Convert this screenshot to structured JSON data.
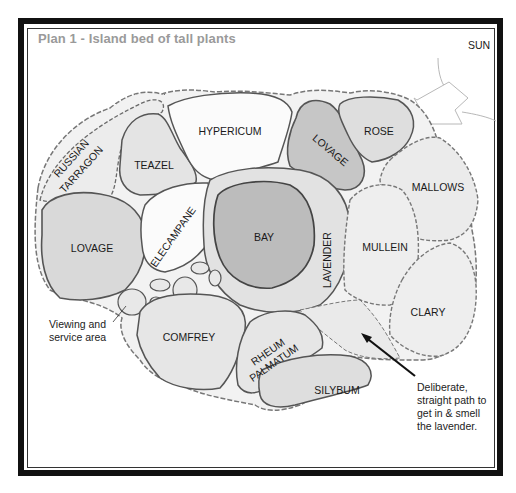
{
  "title": "Plan 1 - Island bed of tall plants",
  "sun_label": "SUN",
  "plants": [
    {
      "name": "RUSSIAN",
      "name2": "TARRAGON"
    },
    {
      "name": "TEAZEL"
    },
    {
      "name": "HYPERICUM"
    },
    {
      "name": "LOVAGE"
    },
    {
      "name": "ROSE"
    },
    {
      "name": "MALLOWS"
    },
    {
      "name": "LOVAGE"
    },
    {
      "name": "ELECAMPANE"
    },
    {
      "name": "BAY"
    },
    {
      "name": "LAVENDER"
    },
    {
      "name": "MULLEIN"
    },
    {
      "name": "CLARY"
    },
    {
      "name": "COMFREY"
    },
    {
      "name": "RHEUM",
      "name2": "PALMATUM"
    },
    {
      "name": "SILYBUM"
    }
  ],
  "annotations": {
    "viewing": [
      "Viewing and",
      "service area"
    ],
    "path": [
      "Deliberate,",
      "straight path to",
      "get in & smell",
      "the lavender."
    ]
  },
  "colors": {
    "frame": "#111111",
    "title": "#9a9a9a",
    "bed_outline": "#555555",
    "bed_fill_light": "#eeeeee",
    "bed_fill_mid": "#d6d6d6",
    "bed_fill_dark": "#bdbdbd"
  }
}
